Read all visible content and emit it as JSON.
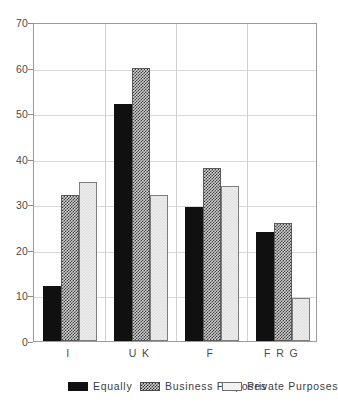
{
  "chart_data": {
    "type": "bar",
    "title": "",
    "subtitle": "",
    "xlabel": "",
    "ylabel": "",
    "categories": [
      "I",
      "U K",
      "F",
      "F R G"
    ],
    "series": [
      {
        "name": "Equally",
        "values": [
          12,
          52,
          29.5,
          24
        ]
      },
      {
        "name": "Business Purposes",
        "values": [
          32,
          60,
          38,
          26
        ]
      },
      {
        "name": "Private Purposes",
        "values": [
          35,
          32,
          34,
          9.5
        ]
      }
    ],
    "ylim": [
      0,
      70
    ],
    "yticks": [
      0,
      10,
      20,
      30,
      40,
      50,
      60,
      70
    ],
    "ytick_labels": [
      "0",
      "10",
      "20",
      "30",
      "40",
      "50",
      "60",
      "70"
    ],
    "grid": true,
    "grid_axis": "both",
    "legend_position": "bottom",
    "colors": {
      "series_equally": "#101010",
      "series_business": "#9a9a9a",
      "series_private": "#ececec",
      "frame": "#9a9a9a",
      "gridline": "#d8d8d8",
      "text": "#3d3d3d",
      "background": "#ffffff"
    }
  },
  "legend": {
    "items": [
      {
        "label": "Equally"
      },
      {
        "label": "Business Purposes"
      },
      {
        "label": "Private Purposes"
      }
    ]
  }
}
